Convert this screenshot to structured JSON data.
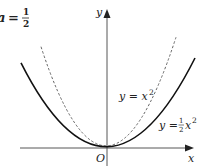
{
  "title": {
    "var": "a",
    "eq": "=",
    "num": "1",
    "den": "2"
  },
  "axes": {
    "x_label": "x",
    "y_label": "y",
    "origin_label": "O"
  },
  "curves": [
    {
      "name": "y = x^2",
      "style": "dashed",
      "label_prefix": "y = x",
      "label_exp": "2",
      "coef": 1
    },
    {
      "name": "y = 1/2 x^2",
      "style": "solid",
      "label_prefix": "y = ",
      "label_num": "1",
      "label_den": "2",
      "label_var": "x",
      "label_exp": "2",
      "coef": 0.5
    }
  ],
  "colors": {
    "axis": "#333333",
    "solid_curve": "#111111",
    "dashed_curve": "#666666"
  }
}
